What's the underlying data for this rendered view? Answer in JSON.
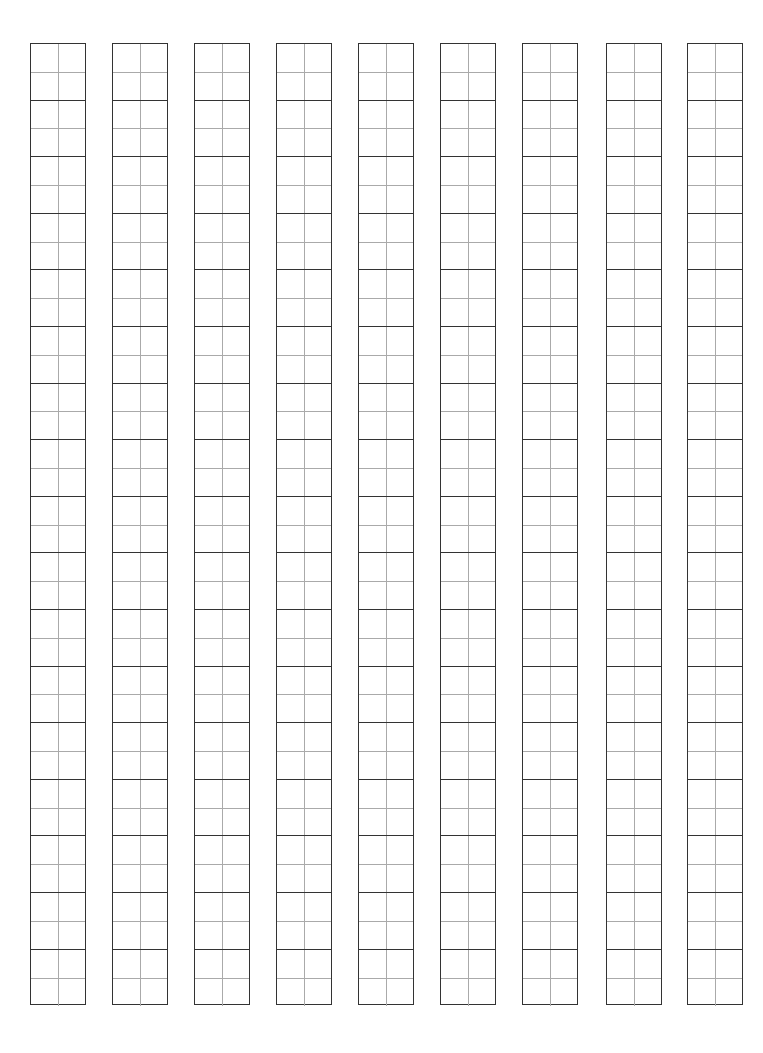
{
  "page": {
    "type": "writing-practice-grid",
    "column_count": 9,
    "rows_per_column": 17,
    "columns_x": [
      30,
      112,
      194,
      276,
      358,
      440,
      522,
      606,
      687
    ],
    "cell_style": "square with center cross guide",
    "colors": {
      "outer_line": "#333333",
      "guide_line": "#aaaaaa",
      "background": "#ffffff"
    }
  }
}
